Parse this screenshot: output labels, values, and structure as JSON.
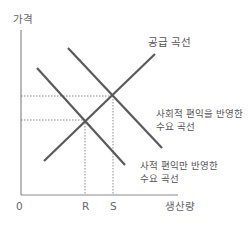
{
  "diagram": {
    "type": "supply-demand",
    "y_axis_label": "가격",
    "x_axis_label": "생산량",
    "origin_label": "0",
    "x_ticks": [
      {
        "label": "R",
        "x": 85
      },
      {
        "label": "S",
        "x": 113
      }
    ],
    "curves": [
      {
        "id": "supply",
        "label": "공급 곡선",
        "x1": 44,
        "y1": 161,
        "x2": 155,
        "y2": 54
      },
      {
        "id": "social-demand",
        "label_line1": "사회적 편익을 반영한",
        "label_line2": "수요 곡선",
        "x1": 68,
        "y1": 48,
        "x2": 162,
        "y2": 148
      },
      {
        "id": "private-demand",
        "label_line1": "사적 편익만 반영한",
        "label_line2": "수요 곡선",
        "x1": 37,
        "y1": 68,
        "x2": 125,
        "y2": 165
      }
    ],
    "equilibria": [
      {
        "id": "private",
        "x": 85,
        "y": 120,
        "quantity_label": "R"
      },
      {
        "id": "social",
        "x": 113,
        "y": 96,
        "quantity_label": "S"
      }
    ],
    "colors": {
      "curve": "#5a5a5a",
      "axis": "#8a8a8a",
      "dotted": "#8a8a8a",
      "text": "#555555"
    }
  }
}
